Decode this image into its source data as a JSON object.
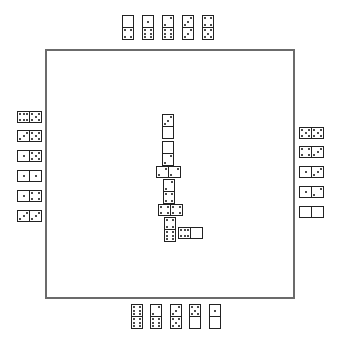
{
  "game": "Dominoes",
  "board": {
    "chain": [
      {
        "a": 3,
        "b": 0,
        "orient": "v",
        "x": 162,
        "y": 114
      },
      {
        "a": 0,
        "b": 2,
        "orient": "v",
        "x": 162,
        "y": 141
      },
      {
        "a": 2,
        "b": 2,
        "orient": "h",
        "x": 156,
        "y": 166
      },
      {
        "a": 2,
        "b": 4,
        "orient": "v",
        "x": 163,
        "y": 179
      },
      {
        "a": 4,
        "b": 4,
        "orient": "h",
        "x": 158,
        "y": 204
      },
      {
        "a": 4,
        "b": 6,
        "orient": "v",
        "x": 164,
        "y": 217
      },
      {
        "a": 6,
        "b": 0,
        "orient": "h",
        "x": 178,
        "y": 227
      }
    ]
  },
  "hands": {
    "top": [
      {
        "a": 0,
        "b": 4,
        "orient": "v",
        "x": 122,
        "y": 15
      },
      {
        "a": 1,
        "b": 6,
        "orient": "v",
        "x": 142,
        "y": 15
      },
      {
        "a": 2,
        "b": 6,
        "orient": "v",
        "x": 162,
        "y": 15
      },
      {
        "a": 3,
        "b": 3,
        "orient": "v",
        "x": 182,
        "y": 15
      },
      {
        "a": 4,
        "b": 5,
        "orient": "v",
        "x": 202,
        "y": 15
      }
    ],
    "left": [
      {
        "a": 6,
        "b": 5,
        "orient": "h",
        "x": 17,
        "y": 111
      },
      {
        "a": 3,
        "b": 5,
        "orient": "h",
        "x": 17,
        "y": 130
      },
      {
        "a": 1,
        "b": 5,
        "orient": "h",
        "x": 17,
        "y": 150
      },
      {
        "a": 1,
        "b": 1,
        "orient": "h",
        "x": 17,
        "y": 170
      },
      {
        "a": 1,
        "b": 4,
        "orient": "h",
        "x": 17,
        "y": 190
      },
      {
        "a": 3,
        "b": 3,
        "orient": "h",
        "x": 17,
        "y": 210
      }
    ],
    "right": [
      {
        "a": 5,
        "b": 5,
        "orient": "h",
        "x": 299,
        "y": 127
      },
      {
        "a": 4,
        "b": 3,
        "orient": "h",
        "x": 299,
        "y": 146
      },
      {
        "a": 1,
        "b": 3,
        "orient": "h",
        "x": 299,
        "y": 166
      },
      {
        "a": 1,
        "b": 2,
        "orient": "h",
        "x": 299,
        "y": 186
      },
      {
        "a": 0,
        "b": 0,
        "orient": "h",
        "x": 299,
        "y": 206
      }
    ],
    "bottom": [
      {
        "a": 6,
        "b": 6,
        "orient": "v",
        "x": 131,
        "y": 304
      },
      {
        "a": 2,
        "b": 6,
        "orient": "v",
        "x": 150,
        "y": 304
      },
      {
        "a": 3,
        "b": 5,
        "orient": "v",
        "x": 170,
        "y": 304
      },
      {
        "a": 5,
        "b": 0,
        "orient": "v",
        "x": 189,
        "y": 304
      },
      {
        "a": 1,
        "b": 0,
        "orient": "v",
        "x": 209,
        "y": 304
      }
    ]
  }
}
